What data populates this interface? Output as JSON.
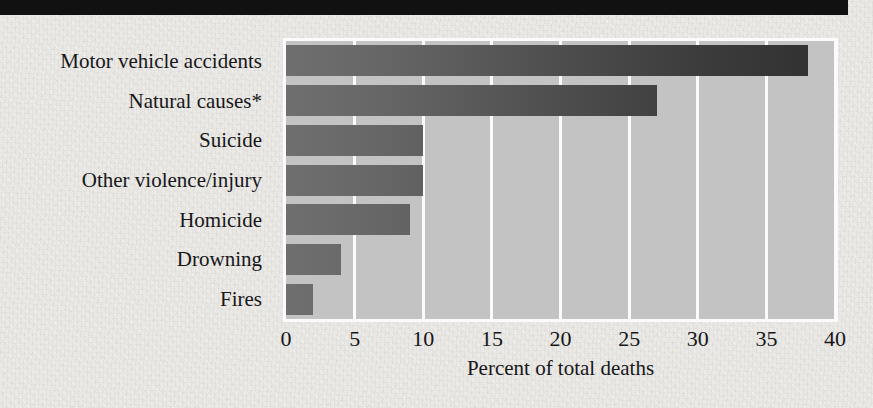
{
  "figure": {
    "background_color": "#e9e8e4",
    "top_band_color": "#111111",
    "plot_background_color": "#c3c3c3",
    "gridline_color": "#fbfbfb",
    "bar_gradient_start": "#6f6f6f",
    "bar_gradient_end": "#303030"
  },
  "chart_data": {
    "type": "bar",
    "orientation": "horizontal",
    "title": "",
    "subtitle": "",
    "xlabel": "Percent of total deaths",
    "ylabel": "",
    "categories": [
      "Motor vehicle accidents",
      "Natural causes*",
      "Suicide",
      "Other violence/injury",
      "Homicide",
      "Drowning",
      "Fires"
    ],
    "values": [
      38,
      27,
      10,
      10,
      9,
      4,
      2
    ],
    "xlim": [
      0,
      40
    ],
    "xticks": [
      0,
      5,
      10,
      15,
      20,
      25,
      30,
      35,
      40
    ],
    "xtick_labels": [
      "0",
      "5",
      "10",
      "15",
      "20",
      "25",
      "30",
      "35",
      "40"
    ],
    "grid": "vertical",
    "legend": "none",
    "annotations": [
      "*"
    ],
    "units": "percent"
  }
}
